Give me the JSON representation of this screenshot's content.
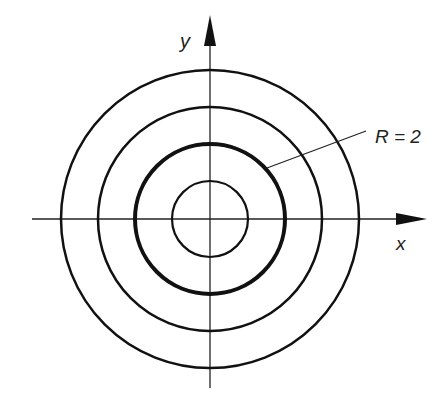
{
  "diagram": {
    "axes": {
      "x_label": "x",
      "y_label": "y"
    },
    "circles": [
      {
        "radius_px": 38,
        "stroke": 2.2,
        "highlighted": false
      },
      {
        "radius_px": 75,
        "stroke": 4,
        "highlighted": true
      },
      {
        "radius_px": 112,
        "stroke": 2.5,
        "highlighted": false
      },
      {
        "radius_px": 149,
        "stroke": 2.5,
        "highlighted": false
      }
    ],
    "annotation": {
      "text": "R = 2",
      "points_to": "highlighted circle"
    },
    "colors": {
      "stroke": "#111111",
      "background": "#ffffff"
    }
  }
}
